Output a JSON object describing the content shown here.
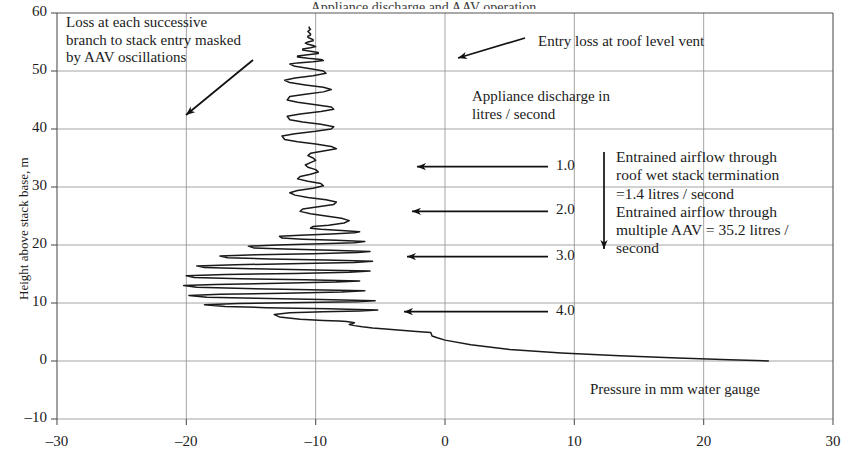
{
  "figure": {
    "cropped_title": "Appliance discharge and AAV operation",
    "y_axis_title": "Height above stack base, m",
    "x_axis_caption": "Pressure in mm water gauge"
  },
  "annotations": {
    "top_left": "Loss at each successive\nbranch to stack entry masked\nby AAV oscillations",
    "entry_loss": "Entry loss at roof level vent",
    "discharge_legend": "Appliance discharge in\nlitres / second",
    "entrained": "Entrained airflow through\nroof wet stack termination\n=1.4 litres / second\nEntrained airflow through\nmultiple AAV = 35.2 litres /\nsecond"
  },
  "series_labels": [
    {
      "label": "1.0",
      "height_m": 33.5
    },
    {
      "label": "2.0",
      "height_m": 25.8
    },
    {
      "label": "3.0",
      "height_m": 18.0
    },
    {
      "label": "4.0",
      "height_m": 8.5
    }
  ],
  "chart_data": {
    "type": "line",
    "title": "Appliance discharge and AAV operation",
    "xlabel": "Pressure in mm water gauge",
    "ylabel": "Height above stack base, m",
    "xlim": [
      -30,
      30
    ],
    "ylim": [
      -10,
      60
    ],
    "xticks": [
      -30,
      -20,
      -10,
      0,
      10,
      20,
      30
    ],
    "yticks": [
      -10,
      0,
      10,
      20,
      30,
      40,
      50,
      60
    ],
    "grid": true,
    "legend": "none",
    "series": [
      {
        "name": "Stack pressure profile with AAV oscillations",
        "x": [
          25.0,
          22.0,
          18.0,
          13.5,
          9.0,
          5.0,
          2.0,
          0.0,
          -0.6,
          -1.0,
          -1.1,
          -2.2,
          -3.4,
          -4.6,
          -5.6,
          -6.4,
          -7.0,
          -7.4,
          -7.0,
          -7.6,
          -8.2,
          -9.4,
          -11.2,
          -12.8,
          -13.2,
          -12.0,
          -9.4,
          -6.6,
          -5.2,
          -9.0,
          -13.8,
          -17.0,
          -18.6,
          -16.0,
          -11.0,
          -6.8,
          -5.4,
          -9.6,
          -14.6,
          -18.4,
          -19.8,
          -17.4,
          -12.4,
          -8.0,
          -6.2,
          -10.4,
          -15.4,
          -19.2,
          -20.2,
          -17.8,
          -12.8,
          -8.4,
          -6.6,
          -10.8,
          -15.8,
          -19.4,
          -20.0,
          -17.0,
          -11.6,
          -7.4,
          -5.8,
          -10.0,
          -15.0,
          -18.6,
          -19.2,
          -16.2,
          -11.0,
          -7.0,
          -5.6,
          -9.2,
          -13.6,
          -16.8,
          -17.4,
          -14.6,
          -10.2,
          -6.8,
          -5.8,
          -8.8,
          -12.4,
          -14.8,
          -15.2,
          -13.0,
          -9.6,
          -7.0,
          -6.2,
          -8.4,
          -11.0,
          -12.6,
          -12.8,
          -11.2,
          -8.8,
          -7.0,
          -6.6,
          -8.0,
          -9.6,
          -10.4,
          -10.2,
          -9.0,
          -7.8,
          -7.4,
          -8.0,
          -9.2,
          -10.4,
          -11.2,
          -11.0,
          -9.8,
          -8.6,
          -8.4,
          -9.2,
          -10.6,
          -11.6,
          -12.0,
          -11.4,
          -10.2,
          -9.4,
          -9.6,
          -10.6,
          -11.4,
          -11.2,
          -10.4,
          -9.8,
          -10.0,
          -10.6,
          -10.8,
          -10.4,
          -10.0,
          -10.2,
          -10.6,
          -10.4,
          -9.4,
          -8.4,
          -8.8,
          -10.0,
          -11.4,
          -12.4,
          -12.6,
          -11.6,
          -10.0,
          -8.8,
          -8.6,
          -9.6,
          -11.0,
          -12.0,
          -12.2,
          -11.2,
          -9.6,
          -8.6,
          -8.8,
          -10.0,
          -11.4,
          -12.2,
          -12.0,
          -10.8,
          -9.4,
          -8.8,
          -9.4,
          -10.8,
          -12.0,
          -12.4,
          -11.6,
          -10.2,
          -9.2,
          -9.4,
          -10.4,
          -11.6,
          -12.0,
          -11.4,
          -10.2,
          -9.4,
          -9.6,
          -10.6,
          -11.4,
          -11.4,
          -10.6,
          -9.8,
          -9.8,
          -10.4,
          -11.0,
          -11.0,
          -10.4,
          -10.0,
          -10.2,
          -10.6,
          -10.8,
          -10.6,
          -10.2,
          -10.2,
          -10.4,
          -10.6,
          -10.6,
          -10.4,
          -10.4,
          -10.5,
          -10.6,
          -10.5,
          -10.4,
          -10.5,
          -10.5
        ],
        "y": [
          0.0,
          0.2,
          0.5,
          0.9,
          1.4,
          2.0,
          2.8,
          3.6,
          4.0,
          4.3,
          4.9,
          5.1,
          5.3,
          5.5,
          5.7,
          5.9,
          6.1,
          6.3,
          6.6,
          6.8,
          6.9,
          7.0,
          7.2,
          7.6,
          8.0,
          8.3,
          8.5,
          8.6,
          8.8,
          9.0,
          9.2,
          9.4,
          9.7,
          9.9,
          10.1,
          10.2,
          10.4,
          10.6,
          10.8,
          11.0,
          11.3,
          11.5,
          11.7,
          11.9,
          12.1,
          12.3,
          12.5,
          12.7,
          13.0,
          13.2,
          13.4,
          13.6,
          13.8,
          14.0,
          14.2,
          14.4,
          14.7,
          14.9,
          15.1,
          15.3,
          15.5,
          15.7,
          15.9,
          16.1,
          16.4,
          16.6,
          16.8,
          17.0,
          17.2,
          17.4,
          17.6,
          17.8,
          18.1,
          18.3,
          18.5,
          18.7,
          18.9,
          19.1,
          19.3,
          19.5,
          19.8,
          20.0,
          20.2,
          20.4,
          20.6,
          20.8,
          21.0,
          21.2,
          21.5,
          21.7,
          21.9,
          22.1,
          22.3,
          22.5,
          22.7,
          22.9,
          23.2,
          23.4,
          23.8,
          24.2,
          24.6,
          25.0,
          25.4,
          25.8,
          26.2,
          26.6,
          27.0,
          27.4,
          27.8,
          28.2,
          28.6,
          29.0,
          29.4,
          29.8,
          30.2,
          30.6,
          31.0,
          31.4,
          31.8,
          32.2,
          32.6,
          33.0,
          33.4,
          33.8,
          34.2,
          34.6,
          35.0,
          35.4,
          35.8,
          36.2,
          36.6,
          37.0,
          37.4,
          37.8,
          38.2,
          38.8,
          39.2,
          39.6,
          40.0,
          40.4,
          40.8,
          41.2,
          41.6,
          42.2,
          42.6,
          43.0,
          43.4,
          43.8,
          44.2,
          44.6,
          45.0,
          45.6,
          46.0,
          46.4,
          46.8,
          47.2,
          47.6,
          48.0,
          48.4,
          48.8,
          49.2,
          49.6,
          50.0,
          50.4,
          50.8,
          51.2,
          51.4,
          51.6,
          51.8,
          52.0,
          52.2,
          52.4,
          52.6,
          52.8,
          53.0,
          53.2,
          53.4,
          53.6,
          53.8,
          54.0,
          54.2,
          54.4,
          54.6,
          54.8,
          55.0,
          55.2,
          55.4,
          55.6,
          55.8,
          56.0,
          56.2,
          56.4,
          56.6,
          56.8,
          57.0,
          57.2,
          57.4,
          57.6
        ]
      }
    ]
  }
}
